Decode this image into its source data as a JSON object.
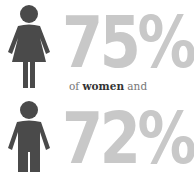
{
  "stats": [
    {
      "group": "women",
      "percent": "75%",
      "icon": "woman-figure-icon"
    },
    {
      "group": "men",
      "percent": "72%",
      "icon": "man-figure-icon"
    }
  ],
  "caption": {
    "prefix": "of ",
    "emphasis": "women",
    "suffix": " and"
  },
  "colors": {
    "figure": "#4a4a4a",
    "percent": "#c8c8c8",
    "caption": "#777777",
    "caption_emphasis": "#333333"
  }
}
